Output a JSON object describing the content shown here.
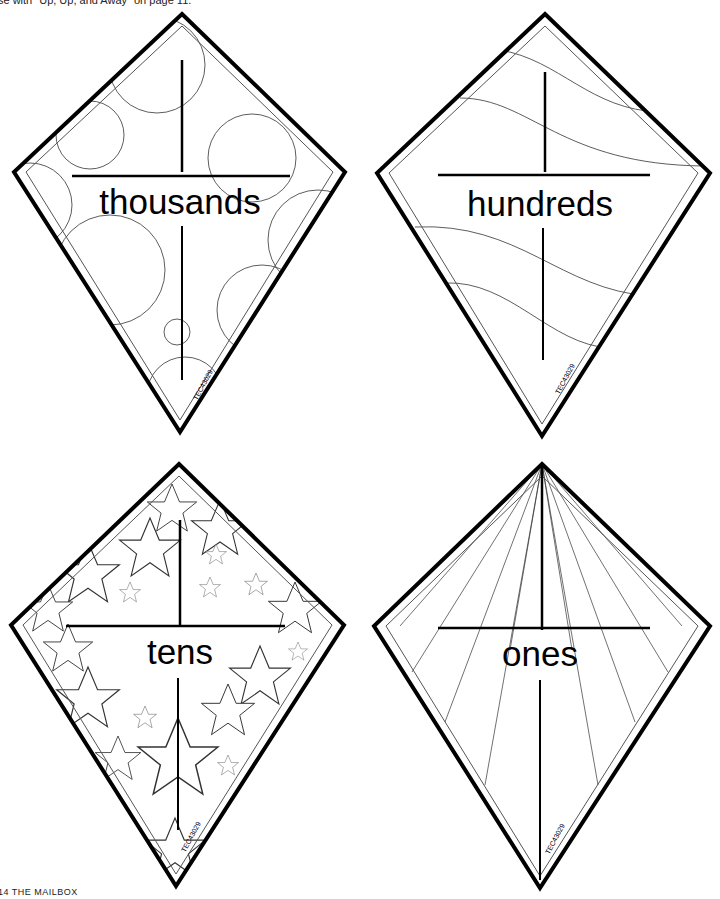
{
  "page": {
    "header_note": "se with \"Up, Up, and Away\" on page 11.",
    "footer": "14  THE MAILBOX"
  },
  "colors": {
    "outline": "#000000",
    "pattern": "#333333",
    "background": "#ffffff"
  },
  "kites": [
    {
      "label": "thousands",
      "pattern": "circles",
      "code": "TEC43029"
    },
    {
      "label": "hundreds",
      "pattern": "waves",
      "code": "TEC43029"
    },
    {
      "label": "tens",
      "pattern": "stars",
      "code": "TEC43029"
    },
    {
      "label": "ones",
      "pattern": "rays",
      "code": "TEC43029"
    }
  ]
}
